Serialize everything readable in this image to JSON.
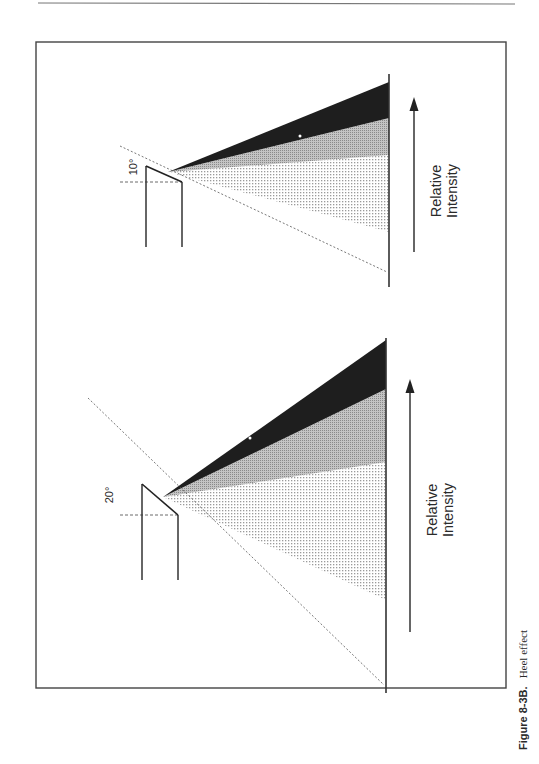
{
  "page": {
    "caption_label": "Figure 8-3B.",
    "caption_text": "Heel effect"
  },
  "colors": {
    "ink": "#2a2a2a",
    "umbra": "#1e1e1e",
    "penumbra": "#a8a8a8",
    "dotted": "#c8c8c8",
    "frame": "#555555"
  },
  "diagrams": [
    {
      "id": "top",
      "angle_label": "10°",
      "axis_label_line1": "Relative",
      "axis_label_line2": "Intensity"
    },
    {
      "id": "bottom",
      "angle_label": "20°",
      "axis_label_line1": "Relative",
      "axis_label_line2": "Intensity"
    }
  ]
}
